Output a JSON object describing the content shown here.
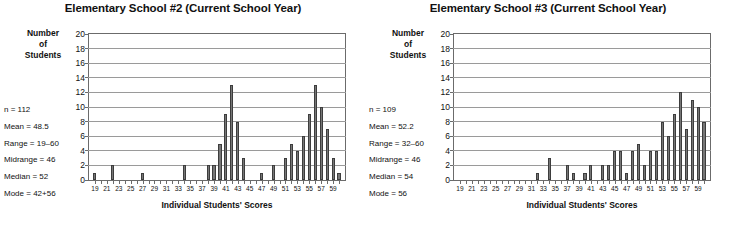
{
  "charts": [
    {
      "id": "school-2",
      "title": "Elementary School #2 (Current School Year)",
      "ycaption_lines": [
        "Number",
        "of",
        "Students"
      ],
      "xlabel": "Individual Students' Scores",
      "stats": [
        "n = 112",
        "Mean = 48.5",
        "Range = 19–60",
        "Midrange = 46",
        "Median = 52",
        "Mode = 42+56"
      ],
      "chart_data": {
        "type": "bar",
        "title": "Elementary School #2 (Current School Year)",
        "xlabel": "Individual Students' Scores",
        "ylabel": "Number of Students",
        "ylim": [
          0,
          20
        ],
        "ytick_labels": [
          "0",
          "2",
          "4",
          "6",
          "8",
          "10",
          "12",
          "14",
          "16",
          "18",
          "20"
        ],
        "yticks": [
          0,
          2,
          4,
          6,
          8,
          10,
          12,
          14,
          16,
          18,
          20
        ],
        "grid": true,
        "legend": "none",
        "xlim": [
          18,
          61
        ],
        "xtick_labels": [
          "19",
          "21",
          "23",
          "25",
          "27",
          "29",
          "31",
          "33",
          "35",
          "37",
          "39",
          "41",
          "43",
          "45",
          "47",
          "49",
          "51",
          "53",
          "55",
          "57",
          "59"
        ],
        "categories": [
          19,
          20,
          21,
          22,
          23,
          24,
          25,
          26,
          27,
          28,
          29,
          30,
          31,
          32,
          33,
          34,
          35,
          36,
          37,
          38,
          39,
          40,
          41,
          42,
          43,
          44,
          45,
          46,
          47,
          48,
          49,
          50,
          51,
          52,
          53,
          54,
          55,
          56,
          57,
          58,
          59,
          60
        ],
        "values": [
          1,
          0,
          0,
          2,
          0,
          0,
          0,
          0,
          1,
          0,
          0,
          0,
          0,
          0,
          0,
          2,
          0,
          0,
          0,
          2,
          2,
          5,
          9,
          13,
          8,
          3,
          0,
          0,
          1,
          0,
          2,
          0,
          3,
          5,
          4,
          6,
          9,
          13,
          10,
          7,
          3,
          1
        ],
        "n": 112,
        "mean": 48.5,
        "range": "19-60",
        "midrange": 46,
        "median": 52,
        "mode": "42+56",
        "bar_color": "#767676"
      }
    },
    {
      "id": "school-3",
      "title": "Elementary School #3 (Current School Year)",
      "ycaption_lines": [
        "Number",
        "of",
        "Students"
      ],
      "xlabel": "Individual Students' Scores",
      "stats": [
        "n = 109",
        "Mean = 52.2",
        "Range = 32–60",
        "Midrange = 46",
        "Median = 54",
        "Mode = 56"
      ],
      "chart_data": {
        "type": "bar",
        "title": "Elementary School #3 (Current School Year)",
        "xlabel": "Individual Students' Scores",
        "ylabel": "Number of Students",
        "ylim": [
          0,
          20
        ],
        "ytick_labels": [
          "0",
          "2",
          "4",
          "6",
          "8",
          "10",
          "12",
          "14",
          "16",
          "18",
          "20"
        ],
        "yticks": [
          0,
          2,
          4,
          6,
          8,
          10,
          12,
          14,
          16,
          18,
          20
        ],
        "grid": true,
        "legend": "none",
        "xlim": [
          18,
          61
        ],
        "xtick_labels": [
          "19",
          "21",
          "23",
          "25",
          "27",
          "29",
          "31",
          "33",
          "35",
          "37",
          "39",
          "41",
          "43",
          "45",
          "47",
          "49",
          "51",
          "53",
          "55",
          "57",
          "59"
        ],
        "categories": [
          19,
          20,
          21,
          22,
          23,
          24,
          25,
          26,
          27,
          28,
          29,
          30,
          31,
          32,
          33,
          34,
          35,
          36,
          37,
          38,
          39,
          40,
          41,
          42,
          43,
          44,
          45,
          46,
          47,
          48,
          49,
          50,
          51,
          52,
          53,
          54,
          55,
          56,
          57,
          58,
          59,
          60
        ],
        "values": [
          0,
          0,
          0,
          0,
          0,
          0,
          0,
          0,
          0,
          0,
          0,
          0,
          0,
          1,
          0,
          3,
          0,
          0,
          2,
          1,
          0,
          1,
          2,
          0,
          2,
          2,
          4,
          4,
          1,
          4,
          5,
          2,
          4,
          4,
          8,
          6,
          9,
          12,
          7,
          11,
          10,
          8
        ],
        "n": 109,
        "mean": 52.2,
        "range": "32-60",
        "midrange": 46,
        "median": 54,
        "mode": 56,
        "bar_color": "#767676"
      }
    }
  ]
}
